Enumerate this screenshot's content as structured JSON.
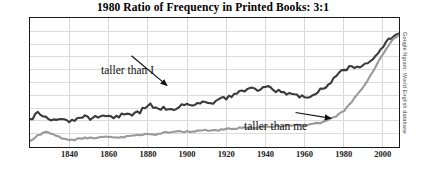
{
  "chart_data": {
    "type": "line",
    "title": "1980 Ratio of Frequency in Printed Books: 3:1",
    "xlabel": "",
    "ylabel": "",
    "source": "Google Ngram: World English database",
    "grid": true,
    "legend_position": "inline-annotations",
    "xlim": [
      1820,
      2008
    ],
    "ylim": [
      0,
      1.0
    ],
    "xticks": [
      "1840",
      "1860",
      "1880",
      "1900",
      "1920",
      "1940",
      "1960",
      "1980",
      "2000"
    ],
    "xtick_values": [
      1840,
      1860,
      1880,
      1900,
      1920,
      1940,
      1960,
      1980,
      2000
    ],
    "yticks": [],
    "annotations": [
      {
        "text": "taller than I",
        "series": "taller than I"
      },
      {
        "text": "taller than me",
        "series": "taller than me"
      }
    ],
    "colors": {
      "series_taller_than_i": "#3a3a3a",
      "series_taller_than_me": "#9a9a9a",
      "frame": "#1a1a1a",
      "grid": "#dcdcdc",
      "title": "#000000"
    },
    "x": [
      1820,
      1824,
      1828,
      1832,
      1836,
      1840,
      1844,
      1848,
      1852,
      1856,
      1860,
      1864,
      1868,
      1872,
      1876,
      1880,
      1884,
      1888,
      1892,
      1896,
      1900,
      1904,
      1908,
      1912,
      1916,
      1920,
      1924,
      1928,
      1932,
      1936,
      1940,
      1944,
      1948,
      1952,
      1956,
      1960,
      1964,
      1968,
      1972,
      1976,
      1980,
      1984,
      1988,
      1992,
      1996,
      2000,
      2004,
      2008
    ],
    "series": [
      {
        "name": "taller than I",
        "color": "#3a3a3a",
        "values": [
          0.21,
          0.26,
          0.23,
          0.2,
          0.22,
          0.19,
          0.21,
          0.23,
          0.22,
          0.25,
          0.24,
          0.23,
          0.26,
          0.25,
          0.27,
          0.33,
          0.31,
          0.3,
          0.29,
          0.31,
          0.34,
          0.33,
          0.35,
          0.34,
          0.36,
          0.38,
          0.4,
          0.43,
          0.45,
          0.44,
          0.47,
          0.45,
          0.42,
          0.41,
          0.4,
          0.38,
          0.41,
          0.44,
          0.49,
          0.55,
          0.6,
          0.63,
          0.62,
          0.65,
          0.7,
          0.78,
          0.85,
          0.88
        ]
      },
      {
        "name": "taller than me",
        "color": "#9a9a9a",
        "values": [
          0.05,
          0.09,
          0.12,
          0.1,
          0.07,
          0.05,
          0.06,
          0.07,
          0.07,
          0.08,
          0.08,
          0.07,
          0.08,
          0.09,
          0.09,
          0.1,
          0.1,
          0.11,
          0.11,
          0.12,
          0.12,
          0.12,
          0.13,
          0.13,
          0.13,
          0.14,
          0.14,
          0.15,
          0.15,
          0.15,
          0.16,
          0.16,
          0.16,
          0.17,
          0.17,
          0.17,
          0.18,
          0.19,
          0.21,
          0.24,
          0.28,
          0.35,
          0.43,
          0.52,
          0.62,
          0.72,
          0.82,
          0.87
        ]
      }
    ]
  },
  "credit": {
    "text": "Google Ngram: World English database"
  }
}
